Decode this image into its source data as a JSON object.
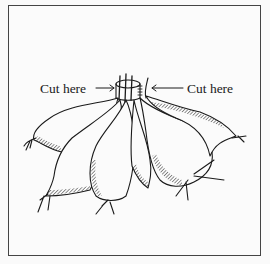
{
  "figure": {
    "labels": {
      "left": "Cut here",
      "right": "Cut here"
    },
    "colors": {
      "ink": "#1a1a1a",
      "frame": "#444444",
      "paper": "#fbfbfb"
    }
  }
}
